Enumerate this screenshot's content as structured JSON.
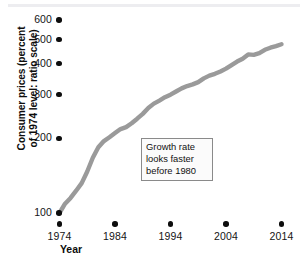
{
  "chart_data": {
    "type": "line",
    "title": "",
    "subtitle": "",
    "xlabel": "Year",
    "ylabel": "Consumer prices (percent of 1974 level: ratio scale)",
    "yscale": "log",
    "ylim": [
      90,
      660
    ],
    "xlim": [
      1974,
      2015
    ],
    "grid": false,
    "legend": null,
    "ytick_labels": [
      "600",
      "500",
      "400",
      "300",
      "200",
      "100"
    ],
    "ytick_values": [
      600,
      500,
      400,
      300,
      200,
      100
    ],
    "xtick_labels": [
      "1974",
      "1984",
      "1994",
      "2004",
      "2014"
    ],
    "xtick_values": [
      1974,
      1984,
      1994,
      2004,
      2014
    ],
    "series": [
      {
        "name": "Consumer prices (percent of 1974 level)",
        "color": "#9a9a9a",
        "x": [
          1974,
          1975,
          1976,
          1977,
          1978,
          1979,
          1980,
          1981,
          1982,
          1983,
          1984,
          1985,
          1986,
          1987,
          1988,
          1989,
          1990,
          1991,
          1992,
          1993,
          1994,
          1995,
          1996,
          1997,
          1998,
          1999,
          2000,
          2001,
          2002,
          2003,
          2004,
          2005,
          2006,
          2007,
          2008,
          2009,
          2010,
          2011,
          2012,
          2013,
          2014
        ],
        "values": [
          100,
          109,
          115,
          123,
          132,
          147,
          167,
          184,
          195,
          202,
          210,
          218,
          222,
          230,
          240,
          251,
          265,
          276,
          284,
          293,
          300,
          309,
          318,
          325,
          330,
          337,
          349,
          358,
          364,
          372,
          382,
          395,
          408,
          419,
          436,
          434,
          441,
          455,
          464,
          471,
          479
        ]
      }
    ],
    "annotations": [
      {
        "name": "growth-rate-note",
        "lines": [
          "Growth rate",
          "looks faster",
          "before 1980"
        ],
        "x": 1984,
        "y": 210
      }
    ]
  },
  "axes": {
    "y": {
      "label": "Consumer prices (percent of 1974 level: ratio scale)",
      "label_line1": "Consumer prices (percent",
      "label_line2": "of 1974 level: ratio scale)",
      "ticks": [
        {
          "label": "600",
          "value": 600
        },
        {
          "label": "500",
          "value": 500
        },
        {
          "label": "400",
          "value": 400
        },
        {
          "label": "300",
          "value": 300
        },
        {
          "label": "200",
          "value": 200
        },
        {
          "label": "100",
          "value": 100
        }
      ]
    },
    "x": {
      "label": "Year",
      "ticks": [
        {
          "label": "1974",
          "value": 1974
        },
        {
          "label": "1984",
          "value": 1984
        },
        {
          "label": "1994",
          "value": 1994
        },
        {
          "label": "2004",
          "value": 2004
        },
        {
          "label": "2014",
          "value": 2014
        }
      ]
    }
  },
  "annotation_box": {
    "line1": "Growth rate",
    "line2": "looks faster",
    "line3": "before 1980"
  },
  "colors": {
    "line": "#9a9a9a",
    "tick_dot": "#0d0d0d",
    "text": "#111111",
    "annotation_border": "#8a8a8a",
    "top_rule": "#ededf0",
    "background": "#ffffff"
  }
}
